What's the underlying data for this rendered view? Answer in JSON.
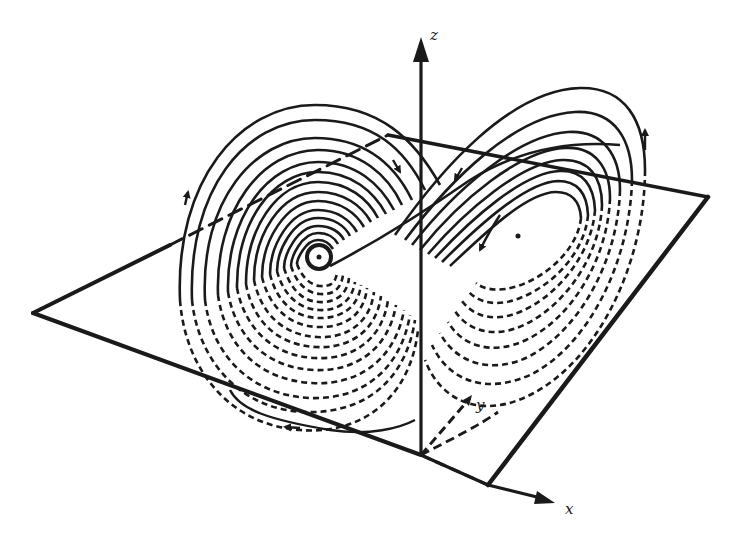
{
  "figure": {
    "axes": {
      "x_label": "x",
      "y_label": "y",
      "z_label": "z"
    },
    "plane": {
      "left_corner": [
        33,
        313
      ],
      "back_corner": [
        388,
        135
      ],
      "right_corner": [
        708,
        197
      ],
      "front_corner": [
        488,
        485
      ]
    },
    "origin": [
      421,
      455
    ],
    "z_axis_tip": [
      421,
      37
    ],
    "x_axis_tip": [
      555,
      503
    ],
    "fixed_points": {
      "left": [
        319,
        257
      ],
      "right": [
        518,
        236
      ]
    },
    "colors": {
      "ink": "#1a1a1a",
      "background": "#ffffff"
    }
  }
}
